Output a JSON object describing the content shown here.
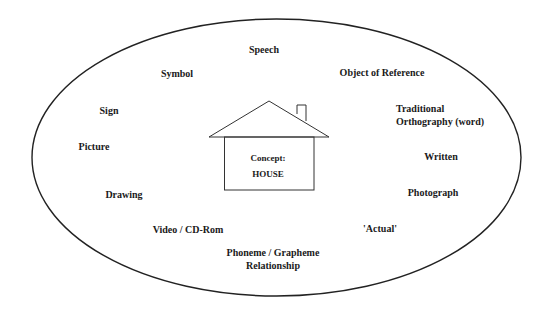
{
  "diagram": {
    "central_concept": {
      "label": "Concept:",
      "value": "HOUSE"
    },
    "representations": {
      "speech": "Speech",
      "symbol": "Symbol",
      "object_of_reference": "Object of Reference",
      "sign": "Sign",
      "traditional_orthography_line1": "Traditional",
      "traditional_orthography_line2": "Orthography (word)",
      "picture": "Picture",
      "written": "Written",
      "drawing": "Drawing",
      "photograph": "Photograph",
      "video": "Video / CD-Rom",
      "actual": "'Actual'",
      "phoneme_line1": "Phoneme / Grapheme",
      "phoneme_line2": "Relationship"
    },
    "colors": {
      "stroke": "#222222",
      "text": "#1a1a1a",
      "background": "#ffffff"
    }
  }
}
